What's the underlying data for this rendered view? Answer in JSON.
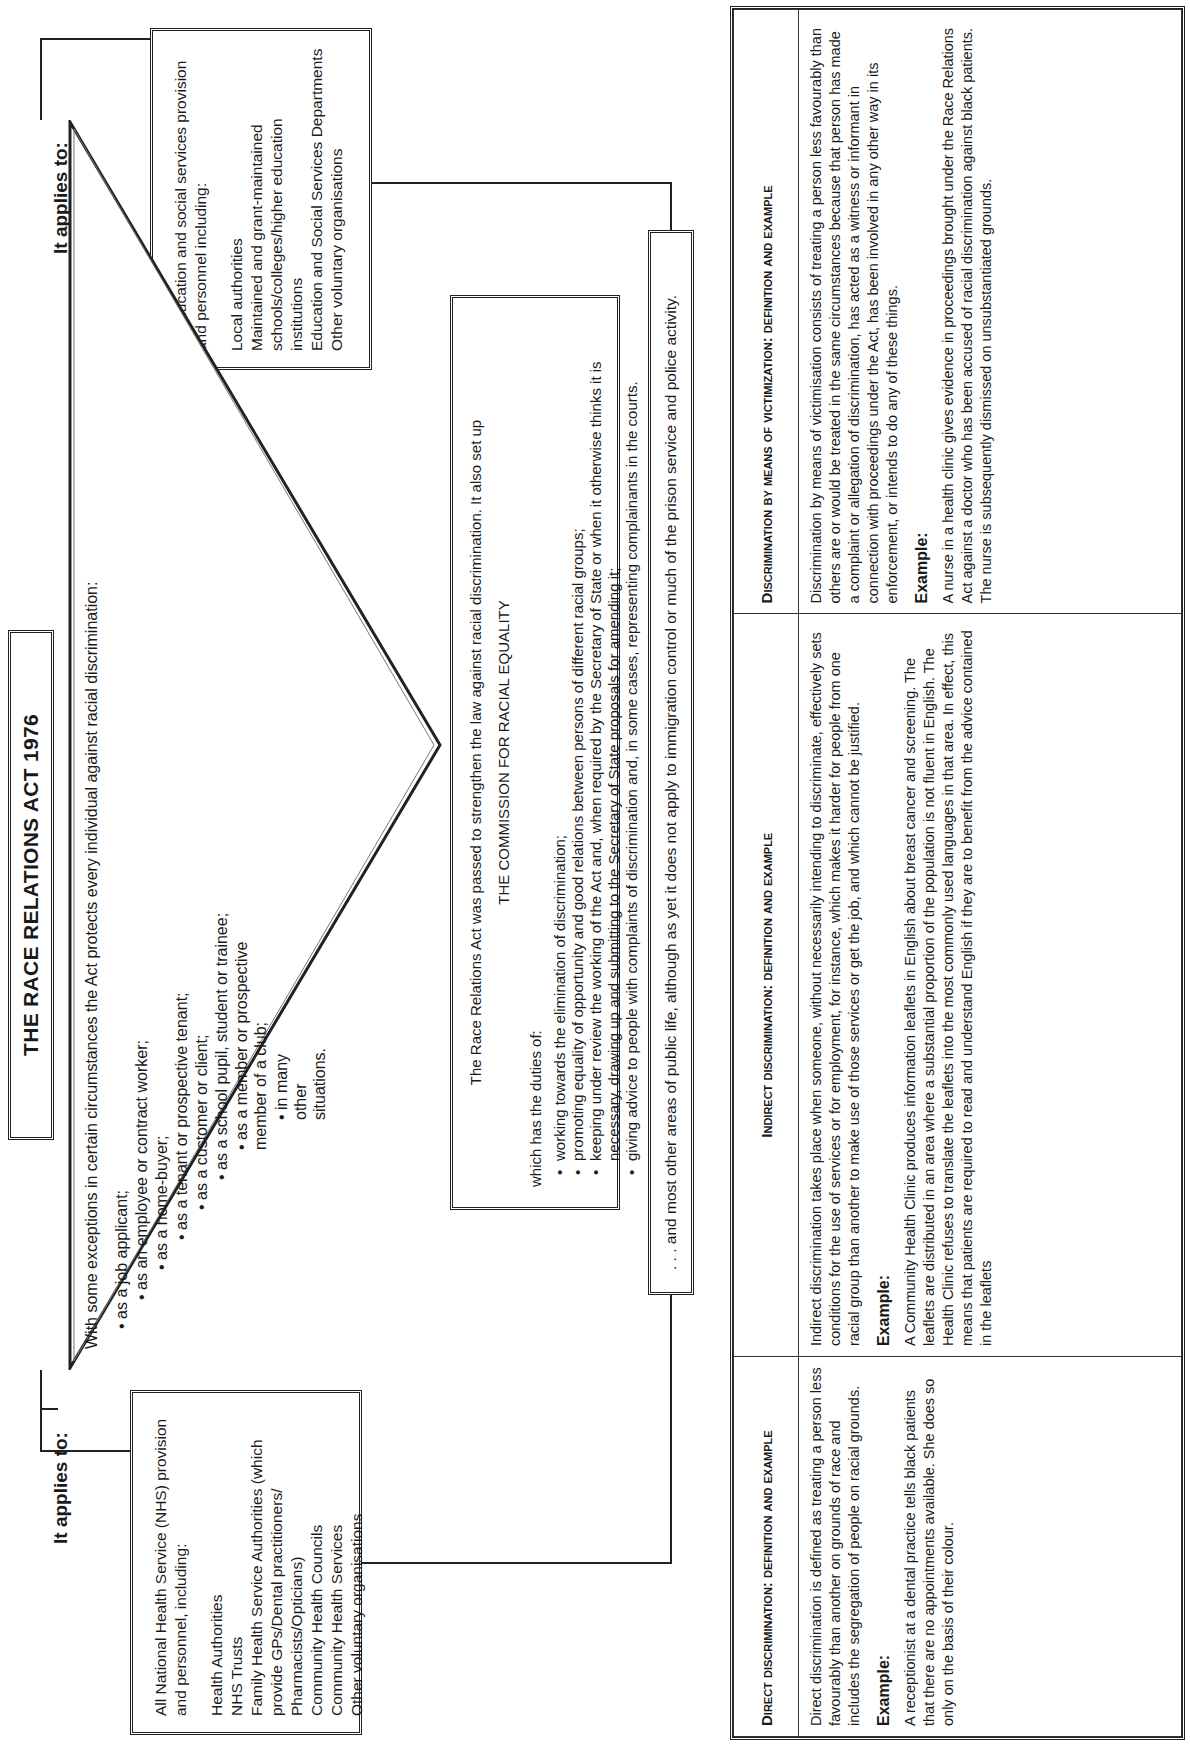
{
  "title": "THE RACE RELATIONS ACT 1976",
  "left_applies": {
    "heading": "It applies to:",
    "intro": "All National Health Service (NHS) provision and personnel, including:",
    "items": [
      "Health Authorities",
      "NHS Trusts",
      "Family Health Service Authorities (which provide GPs/Dental practitioners/ Pharmacists/Opticians)",
      "Community Health Councils",
      "Community Health Services",
      "Other voluntary organisations"
    ]
  },
  "right_applies": {
    "heading": "It applies to:",
    "intro": "All education and social services provision and personnel including:",
    "items": [
      "Local authorities",
      "Maintained and grant-maintained schools/colleges/higher education institutions",
      "Education and Social Services Departments",
      "Other voluntary organisations"
    ]
  },
  "triangle": {
    "intro": "With some exceptions in certain circumstances the Act protects every individual against racial discrimination:",
    "items": [
      "as a job applicant;",
      "as an employee or contract worker;",
      "as a home-buyer;",
      "as a tenant or prospective tenant;",
      "as a customer or client;",
      "as a school pupil, student or trainee;",
      "as a member or prospective member of a club;",
      "in many other situations."
    ]
  },
  "commission": {
    "intro": "The Race Relations Act was passed to strengthen the law against racial discrimination. It also set up",
    "name": "THE COMMISSION FOR RACIAL EQUALITY",
    "duties_label": "which has the duties of:",
    "duties": [
      "working towards the elimination of discrimination;",
      "promoting equality of opportunity and good relations between persons of different racial groups;",
      "keeping under review the working of the Act and, when required by the Secretary of State or when it otherwise thinks it is necessary, drawing up and submitting to the Secretary of State proposals for amending it;",
      "giving advice to people with complaints of discrimination and, in some cases, representing complainants in the courts."
    ]
  },
  "other_areas": ". . . and most other areas of public life, although as yet it does not apply to immigration control or much of the prison service and police activity.",
  "table": {
    "columns": [
      {
        "heading": "Direct discrimination: definition and example",
        "definition": "Direct discrimination is defined as treating a person less favourably than another on grounds of race and includes the segregation of people on racial grounds.",
        "example_label": "Example:",
        "example": "A receptionist at a dental practice tells black patients that there are no appointments available. She does so only on the basis of their colour."
      },
      {
        "heading": "Indirect discrimination: definition and example",
        "definition": "Indirect discrimination takes place when someone, without necessarily intending to discriminate, effectively sets conditions for the use of services or for employment, for instance, which makes it harder for people from one racial group than another to make use of those services or get the job, and which cannot be justified.",
        "example_label": "Example:",
        "example": "A Community Health Clinic produces information leaflets in English about breast cancer and screening. The leaflets are distributed in an area where a substantial proportion of the population is not fluent in English. The Health Clinic refuses to translate the leaflets into the most commonly used languages in that area. In effect, this means that patients are required to read and understand English if they are to benefit from the advice contained in the leaflets"
      },
      {
        "heading": "Discrimination by means of victimization: definition and example",
        "definition": "Discrimination by means of victimisation consists of treating a person less favourably than others are or would be treated in the same circumstances because that person has made a complaint or allegation of discrimination, has acted as a witness or informant in connection with proceedings under the Act, has been involved in any other way in its enforcement, or intends to do any of these things.",
        "example_label": "Example:",
        "example": "A nurse in a health clinic gives evidence in proceedings brought under the Race Relations Act against a doctor who has been accused of racial discrimination against black patients. The nurse is subsequently dismissed on unsubstantiated grounds."
      }
    ]
  }
}
